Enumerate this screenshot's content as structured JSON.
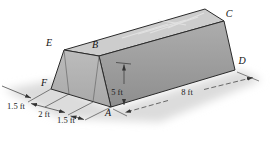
{
  "figure": {
    "vertex_labels": {
      "E": "E",
      "B": "B",
      "C": "C",
      "D": "D",
      "A": "A",
      "F": "F"
    },
    "dimensions": {
      "end_left": "1.5 ft",
      "base_middle": "2 ft",
      "base_right": "1.5 ft",
      "height": "5 ft",
      "length": "8 ft"
    },
    "colors": {
      "top_face": "#cdcdcd",
      "front_face": "#b3b3b3",
      "side_face": "#9c9c9c",
      "edge": "#2a2a2a",
      "shadow": "#dcdcdc",
      "dimension_line": "#333333"
    }
  }
}
